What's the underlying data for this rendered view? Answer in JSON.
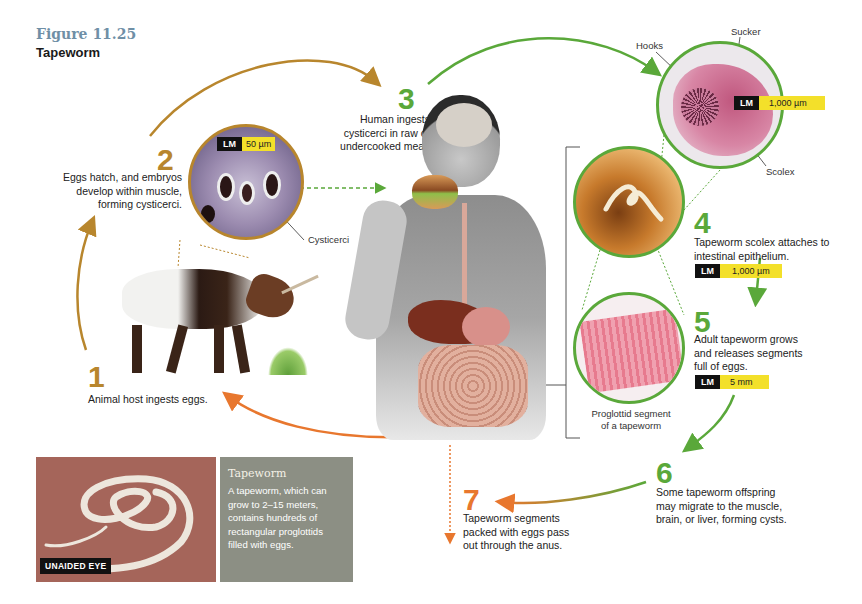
{
  "figure": {
    "number": "Figure 11.25",
    "title": "Tapeworm"
  },
  "colors": {
    "gold": "#b8862d",
    "green": "#5aa83a",
    "orange": "#e8772e",
    "figure_number": "#6f8fa6",
    "scale_yellow": "#f3e02a",
    "infobox_bg": "#8c8f84"
  },
  "steps": [
    {
      "number": "1",
      "text": "Animal host ingests eggs.",
      "color": "gold"
    },
    {
      "number": "2",
      "text": "Eggs hatch, and embryos develop within muscle, forming cysticerci.",
      "color": "gold"
    },
    {
      "number": "3",
      "text": "Human ingests cysticerci in raw or undercooked meat.",
      "color": "green"
    },
    {
      "number": "4",
      "text": "Tapeworm scolex attaches to intestinal epithelium.",
      "color": "green"
    },
    {
      "number": "5",
      "text": "Adult tapeworm grows and releases segments full of eggs.",
      "color": "green"
    },
    {
      "number": "6",
      "text": "Some tapeworm offspring may migrate to the muscle, brain, or liver, forming cysts.",
      "color": "green"
    },
    {
      "number": "7",
      "text": "Tapeworm segments packed with eggs pass out through the anus.",
      "color": "orange"
    }
  ],
  "micrographs": {
    "cysticerci": {
      "scale_type": "LM",
      "scale_value": "50 µm",
      "label": "Cysticerci"
    },
    "scolex": {
      "scale_type": "LM",
      "scale_value": "1,000 µm",
      "labels": {
        "hooks": "Hooks",
        "sucker": "Sucker",
        "scolex": "Scolex"
      }
    },
    "intestine": {
      "scale_type": "LM",
      "scale_value": "1,000 µm"
    },
    "proglottid": {
      "scale_type": "LM",
      "scale_value": "5 mm",
      "caption_line1": "Proglottid segment",
      "caption_line2": "of a tapeworm"
    }
  },
  "photo": {
    "badge": "UNAIDED EYE"
  },
  "infobox": {
    "title": "Tapeworm",
    "text": "A tapeworm, which can grow to 2–15 meters, contains hundreds of rectangular proglottids filled with eggs."
  }
}
